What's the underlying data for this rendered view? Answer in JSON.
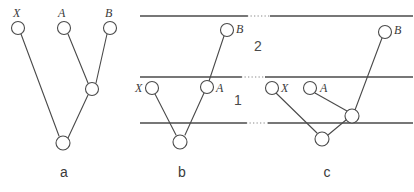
{
  "figure": {
    "background_color": "#ffffff",
    "stroke_color": "#4a4a4a",
    "dotted_color": "#8a8a8a",
    "panels": [
      {
        "id": "a",
        "caption": "a",
        "caption_pos": {
          "x": 64,
          "y": 177
        },
        "tips": [
          {
            "name": "X",
            "label": "X",
            "label_pos": {
              "x": 13,
              "y": 17
            },
            "cx": 18,
            "cy": 28,
            "r": 6.5
          },
          {
            "name": "A",
            "label": "A",
            "label_pos": {
              "x": 58,
              "y": 17
            },
            "cx": 64,
            "cy": 28,
            "r": 6.5
          },
          {
            "name": "B",
            "label": "B",
            "label_pos": {
              "x": 105,
              "y": 17
            },
            "cx": 110,
            "cy": 28,
            "r": 6.5
          }
        ],
        "internal_nodes": [
          {
            "name": "ancestor-ab",
            "cx": 92,
            "cy": 89,
            "r": 6.5
          },
          {
            "name": "root",
            "cx": 63,
            "cy": 143,
            "r": 7.0
          }
        ],
        "edges": [
          {
            "from": "X",
            "to": "root",
            "x1": 21,
            "y1": 34,
            "x2": 59,
            "y2": 136
          },
          {
            "from": "A",
            "to": "ancestor-ab",
            "x1": 68,
            "y1": 34,
            "x2": 88,
            "y2": 83
          },
          {
            "from": "B",
            "to": "ancestor-ab",
            "x1": 107,
            "y1": 34,
            "x2": 96,
            "y2": 83
          },
          {
            "from": "ancestor-ab",
            "to": "root",
            "x1": 88,
            "y1": 95,
            "x2": 68,
            "y2": 138
          }
        ],
        "horizontal_lines": []
      },
      {
        "id": "b",
        "caption": "b",
        "caption_pos": {
          "x": 182,
          "y": 177
        },
        "tips": [
          {
            "name": "X",
            "label": "X",
            "label_pos": {
              "x": 135,
              "y": 92
            },
            "cx": 152,
            "cy": 88,
            "r": 6.5
          },
          {
            "name": "A",
            "label": "A",
            "label_pos": {
              "x": 216,
              "y": 92
            },
            "cx": 207,
            "cy": 87,
            "r": 6.5
          },
          {
            "name": "B",
            "label": "B",
            "label_pos": {
              "x": 236,
              "y": 33
            },
            "cx": 227,
            "cy": 30,
            "r": 6.5
          }
        ],
        "internal_nodes": [
          {
            "name": "root",
            "cx": 180,
            "cy": 142,
            "r": 7.0
          }
        ],
        "edges": [
          {
            "from": "X",
            "to": "root",
            "x1": 155,
            "y1": 94,
            "x2": 176,
            "y2": 135
          },
          {
            "from": "A",
            "to": "root",
            "x1": 204,
            "y1": 93,
            "x2": 185,
            "y2": 135
          },
          {
            "from": "B",
            "to": "A",
            "x1": 224,
            "y1": 36,
            "x2": 209,
            "y2": 81
          }
        ],
        "horizontal_lines": [
          {
            "name": "species-boundary-top",
            "x1": 140,
            "y": 16,
            "x2": 248
          },
          {
            "name": "species-boundary-middle",
            "x1": 140,
            "y": 77,
            "x2": 242
          },
          {
            "name": "species-boundary-bottom",
            "x1": 140,
            "y": 123,
            "x2": 247
          }
        ]
      },
      {
        "id": "c",
        "caption": "c",
        "caption_pos": {
          "x": 327,
          "y": 177
        },
        "tips": [
          {
            "name": "X",
            "label": "X",
            "label_pos": {
              "x": 281,
              "y": 92
            },
            "cx": 272,
            "cy": 88,
            "r": 6.5
          },
          {
            "name": "A",
            "label": "A",
            "label_pos": {
              "x": 320,
              "y": 92
            },
            "cx": 310,
            "cy": 88,
            "r": 6.5
          },
          {
            "name": "B",
            "label": "B",
            "label_pos": {
              "x": 394,
              "y": 34
            },
            "cx": 385,
            "cy": 32,
            "r": 6.5
          }
        ],
        "internal_nodes": [
          {
            "name": "ancestor-ab",
            "cx": 352,
            "cy": 116,
            "r": 7.0
          },
          {
            "name": "root",
            "cx": 322,
            "cy": 139,
            "r": 7.0
          }
        ],
        "edges": [
          {
            "from": "X",
            "to": "root",
            "x1": 276,
            "y1": 93,
            "x2": 317,
            "y2": 133
          },
          {
            "from": "A",
            "to": "ancestor-ab",
            "x1": 315,
            "y1": 93,
            "x2": 347,
            "y2": 111
          },
          {
            "from": "B",
            "to": "ancestor-ab",
            "x1": 382,
            "y1": 38,
            "x2": 355,
            "y2": 110
          },
          {
            "from": "ancestor-ab",
            "to": "root",
            "x1": 346,
            "y1": 120,
            "x2": 328,
            "y2": 135
          }
        ],
        "horizontal_lines": [
          {
            "name": "species-boundary-top",
            "x1": 270,
            "y": 16,
            "x2": 413
          },
          {
            "name": "species-boundary-middle",
            "x1": 265,
            "y": 77,
            "x2": 413
          },
          {
            "name": "species-boundary-bottom",
            "x1": 268,
            "y": 123,
            "x2": 413
          }
        ]
      }
    ],
    "dotted_connectors": [
      {
        "name": "dotted-top",
        "x1": 247,
        "y": 16,
        "x2": 271
      },
      {
        "name": "dotted-middle",
        "x1": 241,
        "y": 77,
        "x2": 266
      },
      {
        "name": "dotted-bottom",
        "x1": 246,
        "y": 123,
        "x2": 269
      }
    ],
    "layer_labels": [
      {
        "name": "layer-2",
        "text": "2",
        "x": 258,
        "y": 51
      },
      {
        "name": "layer-1",
        "text": "1",
        "x": 238,
        "y": 105
      }
    ]
  }
}
